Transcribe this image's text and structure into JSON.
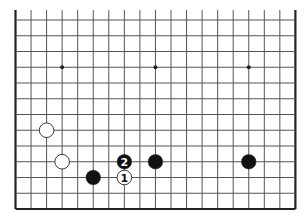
{
  "diagram": {
    "type": "go-board-partial",
    "board_size": 19,
    "visible_columns": 19,
    "visible_rows": 13,
    "edges": {
      "left": true,
      "right": true,
      "bottom": true,
      "top": false
    },
    "geometry": {
      "x0": 15.5,
      "y0": 20,
      "dx": 15.55,
      "dy": 15.75,
      "stone_radius": 7.3
    },
    "colors": {
      "line": "#555555",
      "edge": "#222222",
      "black": "#111111",
      "white": "#ffffff",
      "star": "#222222"
    },
    "star_points": [
      {
        "col": 3,
        "row": 3
      },
      {
        "col": 9,
        "row": 3
      },
      {
        "col": 15,
        "row": 3
      }
    ],
    "stones": [
      {
        "color": "white",
        "col": 2,
        "row": 7,
        "label": ""
      },
      {
        "color": "white",
        "col": 3,
        "row": 9,
        "label": ""
      },
      {
        "color": "black",
        "col": 5,
        "row": 10,
        "label": ""
      },
      {
        "color": "white",
        "col": 7,
        "row": 10,
        "label": "1"
      },
      {
        "color": "black",
        "col": 7,
        "row": 9,
        "label": "2"
      },
      {
        "color": "black",
        "col": 9,
        "row": 9,
        "label": ""
      },
      {
        "color": "black",
        "col": 15,
        "row": 9,
        "label": ""
      }
    ]
  }
}
